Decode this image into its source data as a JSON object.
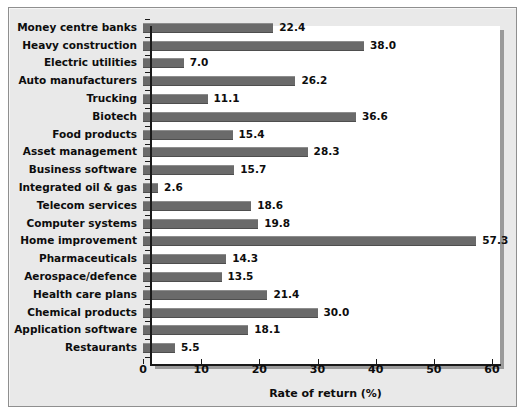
{
  "chart_data": {
    "type": "bar",
    "orientation": "horizontal",
    "title": "",
    "xlabel": "Rate of return (%)",
    "ylabel": "",
    "xlim": [
      0,
      60
    ],
    "xticks": [
      0,
      10,
      20,
      30,
      40,
      50,
      60
    ],
    "xtick_labels": [
      "0",
      "10",
      "20",
      "30",
      "40",
      "50",
      "60"
    ],
    "grid": false,
    "legend": null,
    "bar_color": "#6a6a6a",
    "plot_background": "#ffffff",
    "panel_background": "#e9e9e9",
    "categories": [
      "Money centre banks",
      "Heavy construction",
      "Electric utilities",
      "Auto manufacturers",
      "Trucking",
      "Biotech",
      "Food products",
      "Asset management",
      "Business software",
      "Integrated oil & gas",
      "Telecom services",
      "Computer systems",
      "Home improvement",
      "Pharmaceuticals",
      "Aerospace/defence",
      "Health care plans",
      "Chemical products",
      "Application software",
      "Restaurants"
    ],
    "values": [
      22.4,
      38.0,
      7.0,
      26.2,
      11.1,
      36.6,
      15.4,
      28.3,
      15.7,
      2.6,
      18.6,
      19.8,
      57.3,
      14.3,
      13.5,
      21.4,
      30.0,
      18.1,
      5.5
    ],
    "data_labels": [
      "22.4",
      "38.0",
      "7.0",
      "26.2",
      "11.1",
      "36.6",
      "15.4",
      "28.3",
      "15.7",
      "2.6",
      "18.6",
      "19.8",
      "57.3",
      "14.3",
      "13.5",
      "21.4",
      "30.0",
      "18.1",
      "5.5"
    ]
  }
}
